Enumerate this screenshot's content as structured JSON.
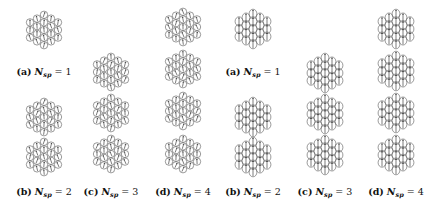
{
  "figure": {
    "groups": [
      {
        "name": "left-random-spins",
        "style": "circle",
        "panels": [
          {
            "id": "a",
            "label": "(a)",
            "var": "N",
            "sub": "sp",
            "eq": "= 1",
            "n": 1,
            "cx": 44,
            "centers_y": [
              30
            ],
            "caption_y": 66
          },
          {
            "id": "b",
            "label": "(b)",
            "var": "N",
            "sub": "sp",
            "eq": "= 2",
            "n": 2,
            "cx": 44,
            "centers_y": [
              117,
              157
            ],
            "caption_y": 186
          },
          {
            "id": "c",
            "label": "(c)",
            "var": "N",
            "sub": "sp",
            "eq": "= 3",
            "n": 3,
            "cx": 111,
            "centers_y": [
              72,
              113,
              154
            ],
            "caption_y": 186
          },
          {
            "id": "d",
            "label": "(d)",
            "var": "N",
            "sub": "sp",
            "eq": "= 4",
            "n": 4,
            "cx": 183,
            "centers_y": [
              27,
              69,
              111,
              154
            ],
            "caption_y": 186
          }
        ]
      },
      {
        "name": "right-aligned-spins",
        "style": "ellipse",
        "panels": [
          {
            "id": "a",
            "label": "(a)",
            "var": "N",
            "sub": "sp",
            "eq": "= 1",
            "n": 1,
            "cx": 253,
            "centers_y": [
              29
            ],
            "caption_y": 66
          },
          {
            "id": "b",
            "label": "(b)",
            "var": "N",
            "sub": "sp",
            "eq": "= 2",
            "n": 2,
            "cx": 253,
            "centers_y": [
              117,
              157
            ],
            "caption_y": 186
          },
          {
            "id": "c",
            "label": "(c)",
            "var": "N",
            "sub": "sp",
            "eq": "= 3",
            "n": 3,
            "cx": 325,
            "centers_y": [
              73,
              114,
              155
            ],
            "caption_y": 186
          },
          {
            "id": "d",
            "label": "(d)",
            "var": "N",
            "sub": "sp",
            "eq": "= 4",
            "n": 4,
            "cx": 396,
            "centers_y": [
              29,
              71,
              113,
              155
            ],
            "caption_y": 186
          }
        ]
      }
    ],
    "colors": {
      "stroke": "#555555",
      "arrow": "#222222",
      "background": "#ffffff"
    }
  }
}
